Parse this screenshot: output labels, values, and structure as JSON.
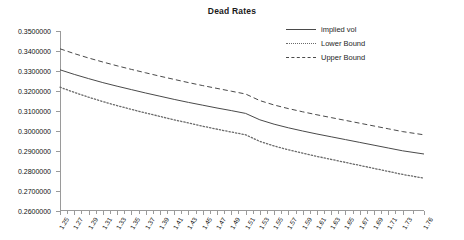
{
  "chart_data": {
    "type": "line",
    "title": "Dead Rates",
    "xlabel": "",
    "ylabel": "",
    "grid": false,
    "legend_position": "top-right",
    "ylim": [
      0.26,
      0.35
    ],
    "ytick_labels": [
      "0.3500000",
      "0.3400000",
      "0.3300000",
      "0.3200000",
      "0.3100000",
      "0.3000000",
      "0.2900000",
      "0.2800000",
      "0.2700000",
      "0.2600000"
    ],
    "ytick_values": [
      0.35,
      0.34,
      0.33,
      0.32,
      0.31,
      0.3,
      0.29,
      0.28,
      0.27,
      0.26
    ],
    "xlim": [
      1.25,
      1.76
    ],
    "xtick_labels": [
      "1.25",
      "1.27",
      "1.29",
      "1.31",
      "1.33",
      "1.35",
      "1.37",
      "1.39",
      "1.41",
      "1.43",
      "1.45",
      "1.47",
      "1.49",
      "1.51",
      "1.53",
      "1.55",
      "1.57",
      "1.59",
      "1.61",
      "1.63",
      "1.65",
      "1.67",
      "1.69",
      "1.71",
      "1.73",
      "1.76"
    ],
    "x": [
      1.25,
      1.27,
      1.29,
      1.31,
      1.33,
      1.35,
      1.37,
      1.39,
      1.41,
      1.43,
      1.45,
      1.47,
      1.49,
      1.51,
      1.53,
      1.55,
      1.57,
      1.59,
      1.61,
      1.63,
      1.65,
      1.67,
      1.69,
      1.71,
      1.73,
      1.76
    ],
    "series": [
      {
        "name": "implied vol",
        "style": "solid",
        "color": "#4a4a4a",
        "values": [
          0.3306,
          0.3283,
          0.3262,
          0.3242,
          0.3224,
          0.3207,
          0.319,
          0.3174,
          0.3158,
          0.3143,
          0.3129,
          0.3115,
          0.3102,
          0.3088,
          0.3056,
          0.3034,
          0.3016,
          0.3,
          0.2985,
          0.2971,
          0.2957,
          0.2943,
          0.2929,
          0.2915,
          0.2901,
          0.2885
        ]
      },
      {
        "name": "Lower Bound",
        "style": "dotted",
        "color": "#6a6a6a",
        "values": [
          0.3219,
          0.3193,
          0.3169,
          0.3147,
          0.3127,
          0.3108,
          0.309,
          0.3073,
          0.3056,
          0.304,
          0.3024,
          0.3009,
          0.2995,
          0.2981,
          0.2948,
          0.2925,
          0.2906,
          0.2889,
          0.2873,
          0.2858,
          0.2843,
          0.2828,
          0.2813,
          0.2798,
          0.2783,
          0.2764
        ]
      },
      {
        "name": "Upper Bound",
        "style": "dashed",
        "color": "#4a4a4a",
        "values": [
          0.3411,
          0.3387,
          0.3365,
          0.3345,
          0.3326,
          0.3308,
          0.3291,
          0.3274,
          0.3258,
          0.3242,
          0.3227,
          0.3213,
          0.3199,
          0.3185,
          0.3152,
          0.313,
          0.3112,
          0.3096,
          0.3081,
          0.3067,
          0.3053,
          0.3039,
          0.3025,
          0.3011,
          0.2997,
          0.2981
        ]
      }
    ],
    "minor_ticks_per_interval": 2
  }
}
